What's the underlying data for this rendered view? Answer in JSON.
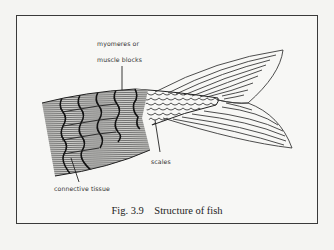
{
  "figure": {
    "caption": "Fig. 3.9    Structure of fish",
    "labels": {
      "myomeres_line1": "myomeres or",
      "myomeres_line2": "muscle blocks",
      "scales": "scales",
      "connective_tissue": "connective tissue"
    },
    "colors": {
      "ink": "#333333",
      "paper": "#f7f7f5",
      "frame": "#3a3a3a"
    }
  }
}
